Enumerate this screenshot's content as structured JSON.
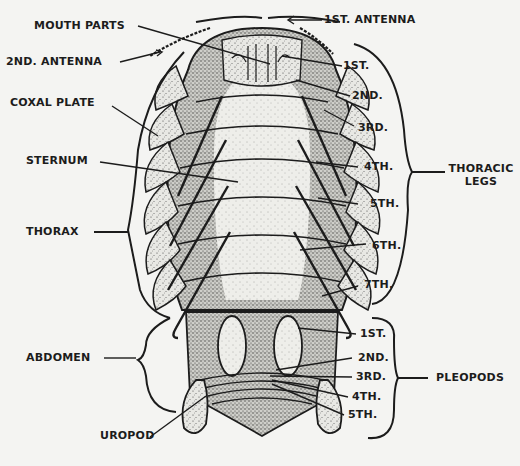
{
  "diagram": {
    "colors": {
      "paper": "#f4f4f2",
      "ink": "#1c1c1c",
      "stipple": "#3a3a3a",
      "body_fill": "#e6e6e2"
    },
    "labels": {
      "left": {
        "mouth_parts": "MOUTH PARTS",
        "second_antenna": "2ND. ANTENNA",
        "coxal_plate": "COXAL PLATE",
        "sternum": "STERNUM",
        "thorax": "THORAX",
        "abdomen": "ABDOMEN",
        "uropod": "UROPOD"
      },
      "top": {
        "first_antenna": "1ST. ANTENNA"
      },
      "thoracic_legs": {
        "group_label_line1": "THORACIC",
        "group_label_line2": "LEGS",
        "items": [
          "1ST.",
          "2ND.",
          "3RD.",
          "4TH.",
          "5TH.",
          "6TH.",
          "7TH."
        ]
      },
      "pleopods": {
        "group_label": "PLEOPODS",
        "items": [
          "1ST.",
          "2ND.",
          "3RD.",
          "4TH.",
          "5TH."
        ]
      }
    }
  }
}
